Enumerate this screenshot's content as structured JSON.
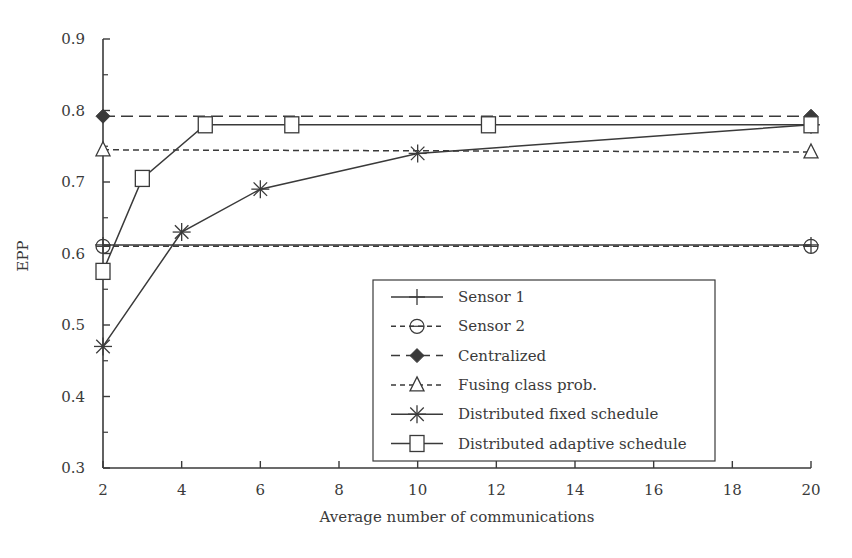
{
  "chart_data": {
    "type": "line",
    "title": "",
    "xlabel": "Average number of communications",
    "ylabel": "EPP",
    "xlim": [
      2,
      20
    ],
    "ylim": [
      0.3,
      0.9
    ],
    "xticks": [
      2,
      4,
      6,
      8,
      10,
      12,
      14,
      16,
      18,
      20
    ],
    "yticks": [
      0.3,
      0.4,
      0.5,
      0.6,
      0.7,
      0.8,
      0.9
    ],
    "ytick_labels": [
      "0.3",
      "0.4",
      "0.5",
      "0.6",
      "0.7",
      "0.8",
      "0.9"
    ],
    "grid": false,
    "legend_position": "lower right",
    "series": [
      {
        "name": "Sensor 1",
        "style": "solid",
        "marker": "plus",
        "x": [
          2,
          20
        ],
        "y": [
          0.612,
          0.612
        ]
      },
      {
        "name": "Sensor 2",
        "style": "dashed",
        "marker": "circle",
        "x": [
          2,
          20
        ],
        "y": [
          0.61,
          0.61
        ]
      },
      {
        "name": "Centralized",
        "style": "long-dashed",
        "marker": "diamond-filled",
        "x": [
          2,
          20
        ],
        "y": [
          0.792,
          0.792
        ]
      },
      {
        "name": "Fusing class prob.",
        "style": "dashed",
        "marker": "triangle",
        "x": [
          2,
          20
        ],
        "y": [
          0.745,
          0.742
        ]
      },
      {
        "name": "Distributed fixed schedule",
        "style": "solid",
        "marker": "asterisk",
        "x": [
          2,
          4,
          6,
          10,
          20
        ],
        "y": [
          0.47,
          0.63,
          0.69,
          0.74,
          0.78
        ]
      },
      {
        "name": "Distributed adaptive schedule",
        "style": "solid",
        "marker": "square",
        "x": [
          2,
          3,
          4.6,
          6.8,
          11.8,
          20
        ],
        "y": [
          0.575,
          0.705,
          0.78,
          0.78,
          0.78,
          0.78
        ]
      }
    ]
  },
  "colors": {
    "line": "#3a3a3a",
    "background": "#ffffff"
  }
}
